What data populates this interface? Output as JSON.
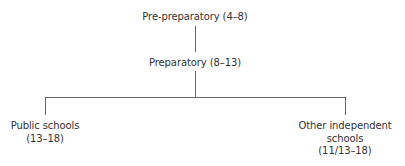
{
  "diagram": {
    "type": "tree",
    "line_color": "#666666",
    "text_color": "#333333",
    "nodes": {
      "root": {
        "lines": [
          "Pre-preparatory (4–8)"
        ]
      },
      "middle": {
        "lines": [
          "Preparatory (8–13)"
        ]
      },
      "left_leaf": {
        "lines": [
          "Public schools",
          "(13–18)"
        ]
      },
      "right_leaf": {
        "lines": [
          "Other independent",
          "schools",
          "(11/13–18)"
        ]
      }
    },
    "edges": [
      [
        "root",
        "middle"
      ],
      [
        "middle",
        "left_leaf"
      ],
      [
        "middle",
        "right_leaf"
      ]
    ]
  }
}
